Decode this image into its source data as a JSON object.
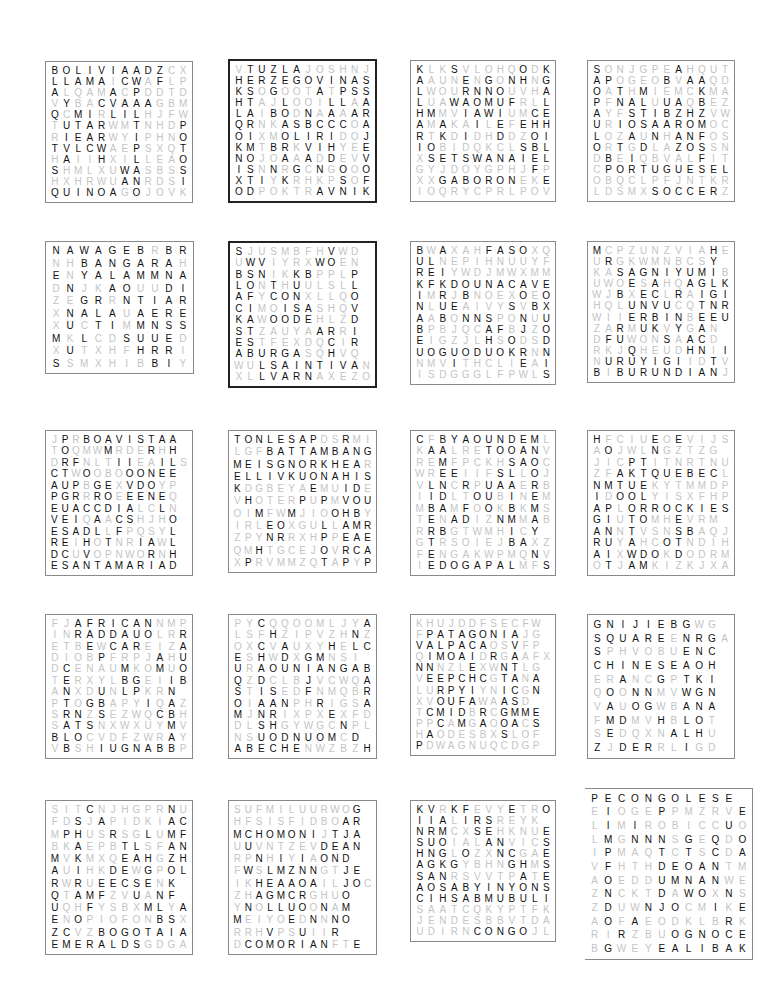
{
  "puzzles": [
    {
      "id": "bolivia",
      "x": 45,
      "y": 61,
      "w": 148,
      "h": 142,
      "style": "normal",
      "rows": [
        "BOLIVIAADZCX",
        "LLAMAICWAFLP",
        "ALQAMACPDDTD",
        "VYBACVAAAGBM",
        "QCMIRLILHJFW",
        "TUTARWMTNHDP",
        "RIEARWYIPHNO",
        "TVLCWAEPSXQT",
        "HAIIHXILLEAO",
        "SHMLXUWASBSS",
        "HXHRWUANRDSI",
        "QUINOAGOJOVK"
      ],
      "mask": [
        "111111111100",
        "111110110100",
        "100001010000",
        "010011111000",
        "101101110000",
        "011110010001",
        "011110010001",
        "111110010001",
        "010010010001",
        "100000110001",
        "000000110001",
        "111111010000"
      ],
      "words": [
        "BOLIVIA",
        "LLAMA",
        "QUINOA",
        "ALTIPLANO",
        "POTOSI"
      ]
    },
    {
      "id": "bosnia",
      "x": 228,
      "y": 59,
      "w": 149,
      "h": 144,
      "style": "thick",
      "rows": [
        "VTUZLAJOSHNJ",
        "HERZEGOVINAS",
        "KSOGOOTATPSS",
        "HTAJLOOILLAA",
        "LAIBODNAAAAR",
        "QRNKASBCCCOA",
        "OIXMOLIRIDOJ",
        "KMTBRKVIHYEE",
        "NOJOAAADDEVV",
        "ISNNRGCNGOOO",
        "XTIYKRHKPSOF",
        "ODPOKTRAVNIK"
      ],
      "mask": [
        "011111000000",
        "111111111111",
        "110100010111",
        "110010001101",
        "110110101011",
        "110011111101",
        "110011111001",
        "110110111001",
        "110010101001",
        "110101010101",
        "111010000101",
        "110000011111"
      ],
      "words": [
        "TUZLA",
        "HERZEGOVINA",
        "STARIMOST",
        "SARAJEVO",
        "TRAVNIK"
      ]
    },
    {
      "id": "botswana",
      "x": 410,
      "y": 60,
      "w": 146,
      "h": 142,
      "style": "normal",
      "rows": [
        "KLKSVLOHQODK",
        "AAUNENGONHNG",
        "LWOURNNOUVHA",
        "LUAWAOMUFRLL",
        "HMMVIAWIUMCE",
        "AMAKAILEFEHH",
        "RTKDIDHDDZOI",
        "IOBIDQKCLSBL",
        "XSETSWANAIEL",
        "GYJDOYGPHJFP",
        "XXGABORONEKE",
        "IOQRYCPRLPOV"
      ],
      "mask": [
        "100100000101",
        "100010101101",
        "100011110001",
        "100111111001",
        "110011110011",
        "101001010111",
        "101010010011",
        "110000000111",
        "011111111111",
        "000000000010",
        "001111111001",
        "000000000000"
      ],
      "words": [
        "KALAHARI",
        "SETSWANA",
        "GABORONE",
        "CHOBE",
        "KGALEHILL"
      ]
    },
    {
      "id": "brazil",
      "x": 587,
      "y": 60,
      "w": 148,
      "h": 142,
      "style": "normal",
      "rows": [
        "SONJGPEAHQUT",
        "APOGEOBVAAQD",
        "OATHMIEMCKMA",
        "PFNALUUAQBEZ",
        "AYFSTIBZHZVW",
        "URIOSAAROMOC",
        "LOZAUNHANFOS",
        "ORTGDLAZOSSN",
        "DBEIQBVALFIT",
        "CPORTUGUESEL",
        "OBQCLPFJNTKR",
        "LDSMXSOCCERZ"
      ],
      "mask": [
        "100000010000",
        "110000101100",
        "101010000100",
        "101110110100",
        "100111111100",
        "101111111100",
        "100101011100",
        "101010011100",
        "010100000100",
        "011111111111",
        "000000000000",
        "000001111110"
      ],
      "words": [
        "SAOPAULO",
        "AMAZON",
        "RIO",
        "PORTUGUESE",
        "SOCCER"
      ]
    },
    {
      "id": "bangladesh",
      "x": 45,
      "y": 241,
      "w": 149,
      "h": 133,
      "style": "normal",
      "rows": [
        "NAWAGEBRBR",
        "NHBANGARAH",
        "ENYALAMMNA",
        "DNJKAOUUDI",
        "ZEGRRNTIAR",
        "XNALAUAERE",
        "XUCTIMMNSS",
        "MKLCDSUUED",
        "XUTXHFHRRI",
        "SSMXHIBBIY"
      ],
      "mask": [
        "1111111011",
        "0011111110",
        "1011111111",
        "0100110011",
        "0011011111",
        "0111101111",
        "0101101111",
        "1010011110",
        "0100001110",
        "1000000110"
      ],
      "words": [
        "BANGARA",
        "YALAMMA",
        "BADARSERI",
        "AIRES",
        "HUMAYUN"
      ]
    },
    {
      "id": "bulgaria",
      "x": 228,
      "y": 241,
      "w": 149,
      "h": 147,
      "style": "thick",
      "rows": [
        "SJUSMBFHVWD",
        "UWVIYRXWOEN",
        "BSNIKKBPPLP",
        "LONTHUULSLL",
        "AFYCONXLLQO",
        "CIMOISASHQV",
        "KAWOODEHLZD",
        "STZAUYAARRI",
        "ESTFEXDQCIR",
        "ABURGASQHVQ",
        "WULSAINTIVAN",
        "XLLVARNAXEZO"
      ],
      "mask": [
        "10000000100",
        "01100001100",
        "11100110001",
        "11010100001",
        "11011100001",
        "11001110001",
        "11011110001",
        "11000001101",
        "11000000101",
        "11111100100",
        "00111111111",
        "00111110000"
      ],
      "words": [
        "BLACKSEA",
        "SOFIA",
        "PLOVDIR",
        "BURGAS",
        "SAINTIVAN",
        "VARNA"
      ]
    },
    {
      "id": "burkinafaso",
      "x": 410,
      "y": 241,
      "w": 146,
      "h": 144,
      "style": "normal",
      "rows": [
        "BWAXAHFASOXQ",
        "ULNEPIHNUUYF",
        "REIYWDJMWXMM",
        "KFKDOUNACAVE",
        "IMRJBNOEXOEO",
        "NLUEAIVYSVBX",
        "AABONNSPONUU",
        "BPBJQCAFBJZO",
        "EIGZJLHSODSD",
        "UOGUODUOKRNN",
        "NMVITHCLIEAI",
        "ISDGGGLFPWLS"
      ],
      "mask": [
        "101000111100",
        "110000000000",
        "111000000000",
        "111111111111",
        "101010000101",
        "101100001011",
        "101011100101",
        "100000110101",
        "100000101001",
        "111111111101",
        "000100000101",
        "000000000001"
      ],
      "words": [
        "BURKINABE",
        "FASO",
        "OUAGADOUGOU",
        "VOLTA",
        "OUAGADOUKR"
      ]
    },
    {
      "id": "burundi",
      "x": 587,
      "y": 241,
      "w": 148,
      "h": 142,
      "style": "normal",
      "rows": [
        "MCPZUNZVIAHE",
        "URGKWMNBCSY",
        "KASAGNIYUMIB",
        "UWOESAHQAGLK",
        "WJBXECLRAIGI",
        "HQLUNVUCQTNR",
        "WIIERBINBEEU",
        "ZARMUKVYGAN",
        "DFUWONSAACD",
        "RKJQHEUDHNII",
        "NURUYIGIIDTV",
        "BIBURUNDIANJ"
      ],
      "mask": [
        "100000000010",
        "010000000010",
        "001111111110",
        "000101001111",
        "001011010111",
        "000111100111",
        "000111110111",
        "001011010100",
        "011000101101",
        "000100001101",
        "011111110010",
        "101111111110"
      ],
      "words": [
        "SAGNIYUMI",
        "HSIGLNE",
        "KIRUNDI",
        "BURUNDIAN",
        "URUYIGI",
        "GITEGA"
      ]
    },
    {
      "id": "capeverde",
      "x": 45,
      "y": 430,
      "w": 148,
      "h": 146,
      "style": "normal",
      "rows": [
        "JPRBOAVISTAA",
        "TOQMWMRDERHH",
        "DRFNLTIIEAILS",
        "CTWOOBOOONEE",
        "AUPBGEXVDOYP",
        "PGRRROEEENEQ",
        "EUACCDIALCLN",
        "VEIQAACSHJHO",
        "ESADLLFPQSYL",
        "REIHOTNRIAWL",
        "DCUVOPNWORNH",
        "ESANTAMARIAD"
      ],
      "mask": [
        "010111111111",
        "010001000101",
        "011000110011",
        "110100011111",
        "111011011100",
        "111011011110",
        "111111110010",
        "111010110001",
        "111110100001",
        "110101001101",
        "110100000101",
        "111111111111"
      ],
      "words": [
        "BOAVISTA",
        "SANTAMARIA",
        "CAPEVERDE",
        "PORTUGUESE",
        "PRAIA"
      ]
    },
    {
      "id": "cambodia",
      "x": 228,
      "y": 430,
      "w": 149,
      "h": 143,
      "style": "normal",
      "rows": [
        "TONLESAPDSRMI",
        "LGFBATTAMBANG",
        "MEISGNORKHEAR",
        "ELLIVKUONAHIS",
        "KDGBEYAEMUIDE",
        "VHOTERPUPMVOU",
        "OIMFWMJIOOHBY",
        "IRLEOXGULLAMR",
        "ZPYNRRXHPPEAE",
        "QMHTGCEJOVRCA",
        "XPRVMMZQTAPYP"
      ],
      "mask": [
        "1111111100100",
        "0001111111111",
        "1111111111110",
        "1111111111111",
        "1000000100110",
        "0100001010111",
        "0010010001110",
        "0001100010111",
        "0001100010111",
        "0010000010111",
        "0100000010101"
      ],
      "words": [
        "TONLESAP",
        "BATTAMBANG",
        "MEISGNORKHEA",
        "ELLIVKUONAHIS",
        "POLPOT",
        "RIVOHAMAERREAP"
      ]
    },
    {
      "id": "cameroon",
      "x": 410,
      "y": 430,
      "w": 146,
      "h": 146,
      "style": "normal",
      "rows": [
        "CFBYAOUNDEML",
        "KAALRETOOANV",
        "REMFPCKHSAOC",
        "WREEIIFSLLOJ",
        "VLNCRPUAAERB",
        "IIDLTOUBINEM",
        "MBAMFOOKBKMS",
        "TENADIZNMMAB",
        "RRBGTWMHICY",
        "GTRSOIEJBAXZ",
        "FENGAKWPMQNV",
        "IEDOGAPALMFS"
      ],
      "mask": [
        "101111111110",
        "011000111110",
        "001000001110",
        "001100011010",
        "011010111010",
        "011001101010",
        "011010101010",
        "010110011010",
        "011000001010",
        "010000001100",
        "010000000010",
        "011111111001"
      ],
      "words": [
        "YAOUNDE",
        "ETOOA",
        "LIBERTE",
        "EDOGAPAL",
        "CAMEROON",
        "MEROMAC"
      ]
    },
    {
      "id": "canada",
      "x": 587,
      "y": 430,
      "w": 148,
      "h": 146,
      "style": "normal",
      "rows": [
        "HFCIUEOEVIJS",
        "AOJWLNGZTZG",
        "JICPTITNRTNU",
        "ZFAKTQUEBECL",
        "NMTUEKYTMMDP",
        "IDOOLYISXFHP",
        "APLORROCKIES",
        "GIUTOMHEVRM",
        "ANNTVSNSBAQJ",
        "RUYAHCOTNDIH",
        "AIXWDOKDODRM",
        "OTJAMKIZKJXA"
      ],
      "mask": [
        "100001010000",
        "010001000000",
        "000110000000",
        "001111111110",
        "111110000000",
        "101110000000",
        "110111111111",
        "110110010000",
        "110100011000",
        "110100110000",
        "110111010000",
        "010110000000"
      ],
      "words": [
        "QUEBEC",
        "ROCKIES",
        "NIAGARA",
        "INUIT",
        "OTTAWA"
      ]
    },
    {
      "id": "centralafrica",
      "x": 45,
      "y": 614,
      "w": 148,
      "h": 145,
      "style": "normal",
      "rows": [
        "FJAFRICANNMP",
        "INRADDAUOLRR",
        "ETBEWCAREIZA",
        "DIOBPFRPJAHU",
        "DCENAUMKOMUO",
        "TERXYLBGEIIB",
        "ANXDUNLPKRN",
        "PTOGBAPYIQAZ",
        "SRNZSEZWQCBH",
        "SATSNXWXUYMV",
        "BLOCVDFZWRAY",
        "VBSHIUGNABBP"
      ],
      "mask": [
        "001111111000",
        "001111111001",
        "000101110001",
        "000010000101",
        "010000100101",
        "010000110011",
        "010010110010",
        "010110001010",
        "011010000110",
        "011100000010",
        "111000000010",
        "010011111110"
      ],
      "words": [
        "AFRICAN",
        "RADDAUO",
        "CAR",
        "CENTRAL",
        "BANGUI",
        "RABMAB"
      ]
    },
    {
      "id": "chad",
      "x": 228,
      "y": 614,
      "w": 149,
      "h": 145,
      "style": "normal",
      "rows": [
        "PYCQQOOMLJYA",
        "LSFHZIPVZHNZ",
        "OXCVAUXYHELC",
        "ESHWDXGMNSI",
        "URAOUNIANGAB",
        "QZDCLBJVCWQA",
        "STISEDFNMQBR",
        "OIAANPHRIGSA",
        "MJNRIXPXEXFD",
        "DLSHGYWGCNPL",
        "NSUODNUOMCD",
        "ABECHENWZBZH"
      ],
      "mask": [
        "001000000001",
        "000100000010",
        "001010001011",
        "101010110001",
        "101111111111",
        "101000100001",
        "101100100001",
        "101110010001",
        "101100001000",
        "001100000100",
        "001111111010",
        "111111000001"
      ],
      "words": [
        "CHADIAN",
        "OUNIANGA",
        "ABECHE",
        "UODNUOM",
        "CIBARA",
        "EUQSOM",
        "FRENCH"
      ]
    },
    {
      "id": "chile",
      "x": 410,
      "y": 614,
      "w": 146,
      "h": 142,
      "style": "normal",
      "rows": [
        "KHUJDDFSECFW",
        "FPATAGONIAJG",
        "VALPACAOSVFP",
        "QIMOAIDRGAAFX",
        "NNNZLEXWNTLG",
        "VEEPCHCGTANA",
        "LURPYIYNICGN",
        "XVOUFAWAASD",
        "TCMIDBRCGMME",
        "PPCAMGAOOACS",
        "HAODESBXSLOF",
        "PDWAGNUQCDGP"
      ],
      "mask": [
        "000000000000",
        "011111111100",
        "111111100100",
        "011111010100",
        "110001001100",
        "011111101101",
        "001111001101",
        "001111001101",
        "011110101111",
        "001010101101",
        "010000001000",
        "100000000000"
      ],
      "words": [
        "PATAGONIA",
        "ALPACA",
        "MOAI",
        "SANTIAGO",
        "ATACAMA",
        "ANDES"
      ]
    },
    {
      "id": "china",
      "x": 587,
      "y": 614,
      "w": 148,
      "h": 145,
      "style": "normal",
      "rows": [
        "GNIJIEBGWG",
        "SQUAREENRGA",
        "SPHVOBUENC",
        "CHINESEAOH",
        "ERANCGPTKI",
        "QOONNMVWGN",
        "VAUOGWBANA",
        "FMDMVHBLOT",
        "SEDQXNALHU",
        "ZJDERRLIGD"
      ],
      "mask": [
        "1111111100",
        "111111011100",
        "1000000111",
        "1111111111",
        "0010010111",
        "0101100111",
        "0101100111",
        "0110010110",
        "0100001110",
        "1011100100"
      ],
      "words": [
        "BEIJING",
        "SQUARE",
        "CHINESE",
        "GREATWALL",
        "HONGKONG",
        "CHINA"
      ]
    },
    {
      "id": "colombia",
      "x": 45,
      "y": 800,
      "w": 148,
      "h": 155,
      "style": "normal",
      "rows": [
        "SITCNJHGPRNU",
        "FDSJAPIDKIAC",
        "MPHUSRSGLUMF",
        "BKAEPBTLSFAN",
        "MVKMXQEAHGZH",
        "AUIHKDEWGPOL",
        "RWRUEECSENK",
        "QTAMFZVUANF",
        "UQHFYSBXMLYA",
        "ENOPIOFONBSX",
        "ZCVZBOGOTAIA",
        "EMERALDSGDGA"
      ],
      "mask": [
        "000100000010",
        "001010000011",
        "011001001011",
        "001000110011",
        "101000111011",
        "101001101011",
        "101011111011",
        "101110010110",
        "100100001101",
        "101000000110",
        "110011111111",
        "111111110000"
      ],
      "words": [
        "SHAKIRA",
        "MARQUEZ",
        "AMAZON",
        "BOGOTA",
        "EMERALDS",
        "CARTAGENA"
      ]
    },
    {
      "id": "comoros",
      "x": 228,
      "y": 800,
      "w": 149,
      "h": 155,
      "style": "normal",
      "rows": [
        "SUFMILUURWOG",
        "HFSISFIDBOAR",
        "MCHOMONIJTJA",
        "UUVNTZEVDEAN",
        "RPNHIYIAOND",
        "FWSLMZNNGTJE",
        "IKHEAAOAILJOC",
        "ZHAGMCRGHUO",
        "YNOLLUOONAM",
        "MEIYOEDNNNO",
        "RRHVPSUIIR",
        "DCOMORIANFTE"
      ],
      "mask": [
        "000000000001",
        "000000000011",
        "111111110111",
        "010000001111",
        "001010101111",
        "010111110011",
        "001111110011",
        "001111100011",
        "010111101011",
        "100001010111",
        "000100100101",
        "011111111001"
      ],
      "words": [
        "CHOMONI",
        "COMORIAN",
        "GRANDECOMORE",
        "ANJOUAN",
        "MOHELI"
      ]
    },
    {
      "id": "congo",
      "x": 410,
      "y": 800,
      "w": 146,
      "h": 142,
      "style": "normal",
      "rows": [
        "KVRKFEVYETRO",
        "IIALIRSREYK",
        "NRMCXSEHKNUE",
        "SUOIALANVICS",
        "HNGLOZXNCGAE",
        "AGKGYBHNGHMS",
        "SANRSVVTPATE",
        "AOSABYINYONS",
        "CIHSABMUBULI",
        "SAATCQKYPTFK",
        "JENDESBBVTDA",
        "UDIRNCONGOJL"
      ],
      "mask": [
        "110110001001",
        "111011100001",
        "111001100001",
        "111000110001",
        "111010011001",
        "111100001101",
        "111000000101",
        "111111111111",
        "111111111111",
        "000000000000",
        "000000000000",
        "000001111100"
      ],
      "words": [
        "KINSHASA",
        "VIRUNGA",
        "MONGO",
        "CONGO",
        "OKIESES",
        "ISAB"
      ]
    },
    {
      "id": "drcongo",
      "x": 585,
      "y": 788,
      "w": 168,
      "h": 172,
      "style": "noleft",
      "rows": [
        "PECONGOLESE",
        "EIOGEPPMZRVE",
        "LIMIROBICCUO",
        "LMGNNNSGEQDO",
        "IPMAQTCTSCDA",
        "VFHTHDEOANTM",
        "AOEDDUMNANWE",
        "ZNCKTDAWOXNS",
        "ZDUWNJOCMIKE",
        "AOFAEODKLBRK",
        "RIRZBUOGNOCE",
        "BGWEYEALIBAK"
      ],
      "mask": [
        "11111111111",
        "010001000001",
        "010100000010",
        "010111010101",
        "010001010101",
        "010001111100",
        "010001111100",
        "010001011010",
        "010011100101",
        "010100000010",
        "001000111111",
        "010001111111"
      ],
      "words": [
        "CONGOLESE",
        "IMPFONDO",
        "PONTEDUDJOUE",
        "KABILA",
        "ECONGO"
      ]
    }
  ]
}
